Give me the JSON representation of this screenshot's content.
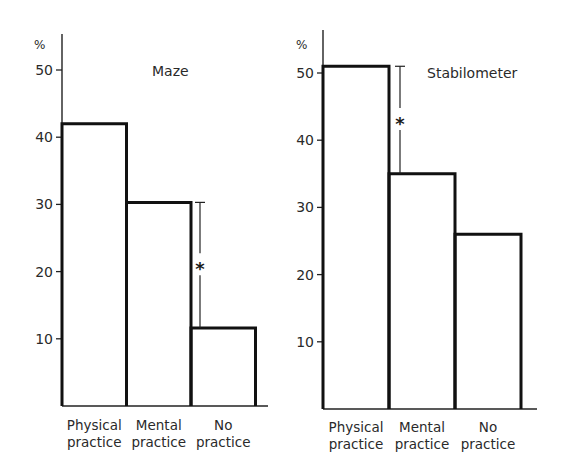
{
  "chart_data": [
    {
      "type": "bar",
      "title": "Maze",
      "ylabel": "%",
      "xlabel": "",
      "ylim": [
        0,
        55
      ],
      "yticks": [
        10,
        20,
        30,
        40,
        50
      ],
      "categories": [
        "Physical practice",
        "Mental practice",
        "No practice"
      ],
      "category_lines": [
        [
          "Physical",
          "practice"
        ],
        [
          "Mental",
          "practice"
        ],
        [
          "No",
          "practice"
        ]
      ],
      "values": [
        42,
        30.3,
        11.6
      ],
      "annotations": [
        {
          "type": "significance",
          "label": "*",
          "between": [
            "Mental practice",
            "No practice"
          ]
        }
      ],
      "grid": false,
      "legend": null
    },
    {
      "type": "bar",
      "title": "Stabilometer",
      "ylabel": "%",
      "xlabel": "",
      "ylim": [
        0,
        55
      ],
      "yticks": [
        10,
        20,
        30,
        40,
        50
      ],
      "categories": [
        "Physical practice",
        "Mental practice",
        "No practice"
      ],
      "category_lines": [
        [
          "Physical",
          "practice"
        ],
        [
          "Mental",
          "practice"
        ],
        [
          "No",
          "practice"
        ]
      ],
      "values": [
        51,
        35,
        26
      ],
      "annotations": [
        {
          "type": "significance",
          "label": "*",
          "between": [
            "Physical practice",
            "Mental practice"
          ]
        }
      ],
      "grid": false,
      "legend": null
    }
  ]
}
